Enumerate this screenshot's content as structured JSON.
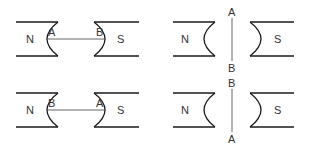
{
  "diagram": {
    "panels": [
      {
        "id": "top-left",
        "north_label": "N",
        "south_label": "S",
        "wire_orientation": "horizontal",
        "wire_end_near_north": "A",
        "wire_end_near_south": "B"
      },
      {
        "id": "top-right",
        "north_label": "N",
        "south_label": "S",
        "wire_orientation": "vertical",
        "wire_end_top": "A",
        "wire_end_bottom": "B"
      },
      {
        "id": "bottom-left",
        "north_label": "N",
        "south_label": "S",
        "wire_orientation": "horizontal",
        "wire_end_near_north": "B",
        "wire_end_near_south": "A"
      },
      {
        "id": "bottom-right",
        "north_label": "N",
        "south_label": "S",
        "wire_orientation": "vertical",
        "wire_end_top": "B",
        "wire_end_bottom": "A"
      }
    ],
    "colors": {
      "stroke": "#1a1a1a",
      "wire": "#555555",
      "text": "#333333"
    }
  }
}
